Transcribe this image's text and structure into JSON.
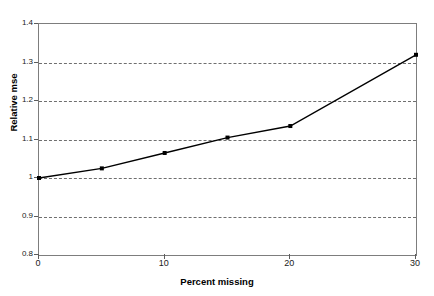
{
  "chart_data": {
    "type": "line",
    "title": "",
    "xlabel": "Percent missing",
    "ylabel": "Relative mse",
    "xlim": [
      0,
      30
    ],
    "ylim": [
      0.8,
      1.4
    ],
    "grid": true,
    "legend": "none",
    "x_ticks": [
      "0",
      "10",
      "20",
      "30"
    ],
    "x_tick_values": [
      0,
      10,
      20,
      30
    ],
    "y_ticks": [
      "0.8",
      "0.9",
      "1",
      "1.1",
      "1.2",
      "1.3",
      "1.4"
    ],
    "y_tick_values": [
      0.8,
      0.9,
      1.0,
      1.1,
      1.2,
      1.3,
      1.4
    ],
    "series": [
      {
        "name": "Relative mse",
        "marker": "square",
        "color": "#000000",
        "x": [
          0,
          5,
          10,
          15,
          20,
          30
        ],
        "values": [
          1.0,
          1.025,
          1.065,
          1.105,
          1.135,
          1.32
        ]
      }
    ]
  },
  "axes": {
    "x_label": "Percent missing",
    "y_label": "Relative mse"
  }
}
